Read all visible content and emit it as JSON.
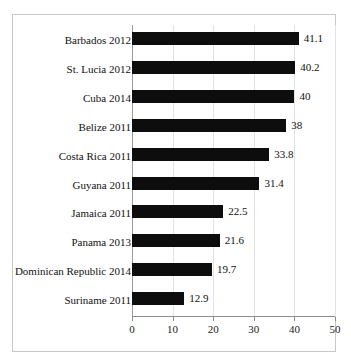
{
  "chart_data": {
    "type": "bar",
    "orientation": "horizontal",
    "title": "",
    "xlabel": "",
    "ylabel": "",
    "xlim": [
      0,
      50
    ],
    "xticks": [
      "0",
      "10",
      "20",
      "30",
      "40",
      "50"
    ],
    "grid": true,
    "legend": "none",
    "bar_color": "#0d0d0d",
    "categories": [
      "Barbados 2012",
      "St. Lucia 2012",
      "Cuba 2014",
      "Belize 2011",
      "Costa Rica 2011",
      "Guyana 2011",
      "Jamaica 2011",
      "Panama 2013",
      "Dominican Republic 2014",
      "Suriname 2011"
    ],
    "values": [
      41.1,
      40.2,
      40,
      38,
      33.8,
      31.4,
      22.5,
      21.6,
      19.7,
      12.9
    ],
    "value_labels": [
      "41.1",
      "40.2",
      "40",
      "38",
      "33.8",
      "31.4",
      "22.5",
      "21.6",
      "19.7",
      "12.9"
    ]
  }
}
